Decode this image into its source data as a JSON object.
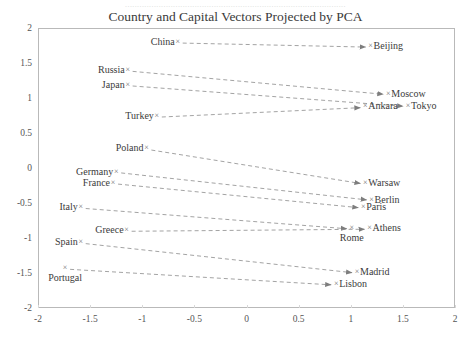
{
  "page_artifact_text": "............................................................................................",
  "chart_data": {
    "type": "scatter",
    "title": "Country and Capital Vectors Projected by PCA",
    "xlabel": "",
    "ylabel": "",
    "xlim": [
      -2,
      2
    ],
    "ylim": [
      -2,
      2
    ],
    "xticks": [
      "-2",
      "-1.5",
      "-1",
      "-0.5",
      "0",
      "0.5",
      "1",
      "1.5",
      "2"
    ],
    "yticks": [
      "-2",
      "-1.5",
      "-1",
      "-0.5",
      "0",
      "0.5",
      "1",
      "1.5",
      "2"
    ],
    "xtick_values": [
      -2,
      -1.5,
      -1,
      -0.5,
      0,
      0.5,
      1,
      1.5,
      2
    ],
    "ytick_values": [
      -2,
      -1.5,
      -1,
      -0.5,
      0,
      0.5,
      1,
      1.5,
      2
    ],
    "grid": false,
    "legend": "none",
    "marker_glyph": "×",
    "line_style": "dashed",
    "arrow": true,
    "series": [
      {
        "name": "country-capital-vectors",
        "pairs": [
          {
            "country": "China",
            "capital": "Beijing",
            "country_xy": [
              -0.66,
              1.8
            ],
            "capital_xy": [
              1.19,
              1.74
            ],
            "country_label_pos": "left",
            "capital_label_pos": "right"
          },
          {
            "country": "Russia",
            "capital": "Moscow",
            "country_xy": [
              -1.14,
              1.4
            ],
            "capital_xy": [
              1.36,
              1.06
            ],
            "country_label_pos": "left",
            "capital_label_pos": "right"
          },
          {
            "country": "Japan",
            "capital": "Tokyo",
            "country_xy": [
              -1.14,
              1.19
            ],
            "capital_xy": [
              1.55,
              0.89
            ],
            "country_label_pos": "left",
            "capital_label_pos": "right"
          },
          {
            "country": "Turkey",
            "capital": "Ankara",
            "country_xy": [
              -0.86,
              0.74
            ],
            "capital_xy": [
              1.14,
              0.88
            ],
            "country_label_pos": "left",
            "capital_label_pos": "right"
          },
          {
            "country": "Poland",
            "capital": "Warsaw",
            "country_xy": [
              -0.96,
              0.28
            ],
            "capital_xy": [
              1.14,
              -0.22
            ],
            "country_label_pos": "left",
            "capital_label_pos": "right"
          },
          {
            "country": "Germany",
            "capital": "Berlin",
            "country_xy": [
              -1.25,
              -0.05
            ],
            "capital_xy": [
              1.2,
              -0.45
            ],
            "country_label_pos": "left",
            "capital_label_pos": "right"
          },
          {
            "country": "France",
            "capital": "Paris",
            "country_xy": [
              -1.28,
              -0.21
            ],
            "capital_xy": [
              1.12,
              -0.56
            ],
            "country_label_pos": "left",
            "capital_label_pos": "right"
          },
          {
            "country": "Italy",
            "capital": "Rome",
            "country_xy": [
              -1.59,
              -0.56
            ],
            "capital_xy": [
              1.01,
              -0.86
            ],
            "country_label_pos": "left",
            "capital_label_pos": "below"
          },
          {
            "country": "Greece",
            "capital": "Athens",
            "country_xy": [
              -1.15,
              -0.89
            ],
            "capital_xy": [
              1.18,
              -0.86
            ],
            "country_label_pos": "left",
            "capital_label_pos": "right"
          },
          {
            "country": "Spain",
            "capital": "Madrid",
            "country_xy": [
              -1.59,
              -1.06
            ],
            "capital_xy": [
              1.06,
              -1.49
            ],
            "country_label_pos": "left",
            "capital_label_pos": "right"
          },
          {
            "country": "Portugal",
            "capital": "Lisbon",
            "country_xy": [
              -1.74,
              -1.43
            ],
            "capital_xy": [
              0.86,
              -1.66
            ],
            "country_label_pos": "below",
            "capital_label_pos": "right"
          }
        ]
      }
    ],
    "colors": {
      "frame": "#b9b9b9",
      "line": "#8c8c8c",
      "text": "#3b3b3b",
      "tick_text": "#555555",
      "marker": "#6f6f6f",
      "background": "#ffffff"
    }
  }
}
